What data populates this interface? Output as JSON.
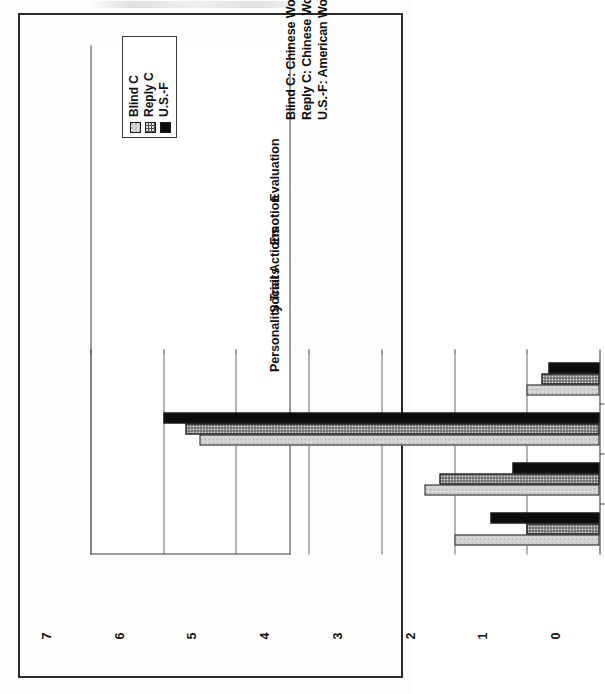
{
  "figure": {
    "orientation": "rotated-90",
    "border_color": "#2b2b2b"
  },
  "legend": {
    "items": [
      {
        "label": "Blind C",
        "swatch": "light-gray-dotted",
        "color": "#e0e0e0"
      },
      {
        "label": "Reply C",
        "swatch": "dark-gray-textured",
        "color": "#4c4c4c"
      },
      {
        "label": "U.S.-F",
        "swatch": "black-solid",
        "color": "#0c0c0c"
      }
    ]
  },
  "caption": {
    "lines": [
      "Blind C: Chinese Women Students, Letters to Unknown Americans",
      "Reply C: Chinese Women Students, Letters in Reply to American Letters",
      "U.S.-F: American Women Students, Letters to Each Other and Unknown Chinese"
    ]
  },
  "chart_data": {
    "type": "bar",
    "title": "",
    "subtitle": "",
    "xlabel": "",
    "ylabel": "",
    "orientation": "horizontal",
    "grid": true,
    "legend_position": "top-inside",
    "categories": [
      "Evaluation",
      "Emotion",
      "Social Actions",
      "Personality Traits"
    ],
    "ylim": [
      0,
      7
    ],
    "yticks": [
      0,
      1,
      2,
      3,
      4,
      5,
      6,
      7
    ],
    "ytick_labels": [
      "0",
      "1",
      "2",
      "3",
      "4",
      "5",
      "6",
      "7"
    ],
    "series": [
      {
        "name": "Blind C",
        "color": "#e0e0e0",
        "values": [
          2.0,
          2.4,
          5.5,
          1.0
        ]
      },
      {
        "name": "Reply C",
        "color": "#4c4c4c",
        "values": [
          1.0,
          2.2,
          5.7,
          0.8
        ]
      },
      {
        "name": "U.S.-F",
        "color": "#0c0c0c",
        "values": [
          1.5,
          1.2,
          6.0,
          0.7
        ]
      }
    ]
  }
}
